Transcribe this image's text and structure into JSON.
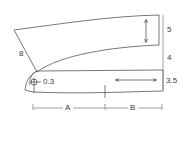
{
  "diagram": {
    "type": "collar-pattern",
    "stroke_color": "#555555",
    "background": "#ffffff",
    "labels": {
      "collar_height_top": "5",
      "collar_height_mid": "4",
      "stand_height": "3.5",
      "collar_point_edge": "8",
      "button_offset": "0.3",
      "segment_a": "A",
      "segment_b": "B"
    },
    "pieces": [
      {
        "name": "collar-fall",
        "grainline": "vertical"
      },
      {
        "name": "collar-stand",
        "grainline": "horizontal",
        "mark": "button-mark"
      }
    ]
  }
}
